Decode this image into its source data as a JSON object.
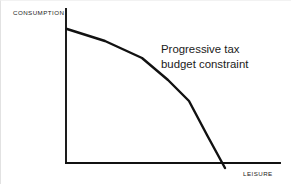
{
  "figure": {
    "background_color": "#ffffff",
    "ink_color": "#111111",
    "width": 291,
    "height": 184
  },
  "axes": {
    "y_axis_label": "CONSUMPTION",
    "x_axis_label": "LEISURE",
    "origin": {
      "x": 66,
      "y": 163
    },
    "y_axis_top": {
      "x": 66,
      "y": 9
    },
    "x_axis_right": {
      "x": 280,
      "y": 163
    },
    "axis_line_width": 1.9
  },
  "annotation": {
    "line1": "Progressive tax",
    "line2": "budget constraint"
  },
  "chart_data": {
    "type": "line",
    "title": "",
    "xlabel": "LEISURE",
    "ylabel": "CONSUMPTION",
    "grid": false,
    "legend": false,
    "axis_arrowheads": false,
    "xlim": [
      66,
      280
    ],
    "ylim": [
      163,
      9
    ],
    "series": [
      {
        "name": "Progressive tax budget constraint",
        "description": "Piecewise-linear, concave-to-origin budget line with kinks where marginal tax rates rise",
        "stroke_color": "#111111",
        "stroke_width": 2.4,
        "points": [
          {
            "x": 67,
            "y": 29,
            "role": "intercept-on-consumption-axis"
          },
          {
            "x": 105,
            "y": 41,
            "role": "segment"
          },
          {
            "x": 142,
            "y": 58,
            "role": "kink-1"
          },
          {
            "x": 168,
            "y": 80,
            "role": "segment"
          },
          {
            "x": 189,
            "y": 101,
            "role": "kink-2"
          },
          {
            "x": 207,
            "y": 135,
            "role": "segment"
          },
          {
            "x": 225,
            "y": 168,
            "role": "crosses-leisure-axis"
          }
        ]
      }
    ]
  }
}
